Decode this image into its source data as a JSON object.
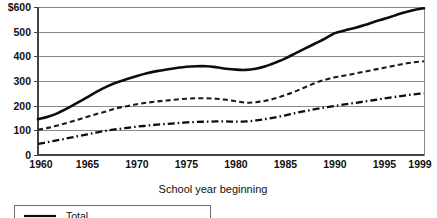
{
  "chart_data": {
    "type": "line",
    "title": "",
    "subtitle": "",
    "xlabel": "School year beginning",
    "ylabel": "",
    "x": [
      1960,
      1961,
      1962,
      1963,
      1964,
      1965,
      1966,
      1967,
      1968,
      1969,
      1970,
      1971,
      1972,
      1973,
      1974,
      1975,
      1976,
      1977,
      1978,
      1979,
      1980,
      1981,
      1982,
      1983,
      1984,
      1985,
      1986,
      1987,
      1988,
      1989,
      1990,
      1991,
      1992,
      1993,
      1994,
      1995,
      1996,
      1997,
      1998,
      1999
    ],
    "xlim": [
      1960,
      1999
    ],
    "ylim": [
      0,
      600
    ],
    "y_ticks": [
      0,
      100,
      200,
      300,
      400,
      500,
      600
    ],
    "y_tick_labels": [
      "0",
      "100",
      "200",
      "300",
      "400",
      "500",
      "$600"
    ],
    "x_ticks": [
      1960,
      1965,
      1970,
      1975,
      1980,
      1985,
      1990,
      1995,
      1999
    ],
    "x_tick_labels": [
      "1960",
      "1965",
      "1970",
      "1975",
      "1980",
      "1985",
      "1990",
      "1995",
      "1999"
    ],
    "grid": "horizontal",
    "legend_position": "bottom-left",
    "series": [
      {
        "name": "Total",
        "style": "solid",
        "color": "#0d0d0d",
        "values": [
          145,
          155,
          170,
          190,
          212,
          235,
          258,
          278,
          295,
          308,
          320,
          331,
          340,
          347,
          353,
          358,
          360,
          360,
          356,
          350,
          346,
          345,
          350,
          360,
          375,
          392,
          412,
          432,
          452,
          472,
          494,
          505,
          515,
          527,
          540,
          552,
          565,
          578,
          588,
          595
        ]
      },
      {
        "name": "",
        "style": "dashed",
        "color": "#1a1a1a",
        "values": [
          102,
          110,
          120,
          131,
          143,
          155,
          167,
          178,
          190,
          198,
          206,
          212,
          217,
          221,
          225,
          228,
          230,
          230,
          228,
          224,
          218,
          212,
          214,
          220,
          230,
          243,
          258,
          275,
          292,
          305,
          315,
          322,
          330,
          338,
          346,
          354,
          362,
          370,
          376,
          380
        ]
      },
      {
        "name": "",
        "style": "dash-dot",
        "color": "#0d0d0d",
        "values": [
          45,
          52,
          60,
          68,
          76,
          84,
          92,
          99,
          105,
          110,
          115,
          119,
          123,
          126,
          129,
          132,
          134,
          135,
          136,
          136,
          135,
          136,
          140,
          146,
          153,
          161,
          170,
          178,
          186,
          193,
          199,
          205,
          211,
          217,
          223,
          229,
          235,
          241,
          246,
          250
        ]
      }
    ]
  },
  "axis": {
    "x_title": "School year beginning"
  },
  "legend": {
    "items": [
      {
        "label": "Total",
        "style": "solid"
      }
    ]
  },
  "geometry": {
    "plot_left": 38,
    "plot_right": 424,
    "plot_top": 7,
    "plot_bottom": 155
  }
}
